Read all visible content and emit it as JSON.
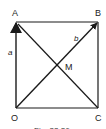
{
  "figure": {
    "points": {
      "O": {
        "label": "O",
        "x": 16,
        "y": 108
      },
      "A": {
        "label": "A",
        "x": 16,
        "y": 22
      },
      "B": {
        "label": "B",
        "x": 98,
        "y": 22
      },
      "C": {
        "label": "C",
        "x": 98,
        "y": 108
      },
      "M": {
        "label": "M"
      }
    },
    "vectors": {
      "a": {
        "label": "a",
        "from": "O",
        "to": "A"
      },
      "b": {
        "label": "b",
        "from": "O",
        "to": "B"
      }
    },
    "caption": "Fig. 22.26",
    "colors": {
      "line": "#1a1a1a",
      "text": "#222222"
    }
  }
}
